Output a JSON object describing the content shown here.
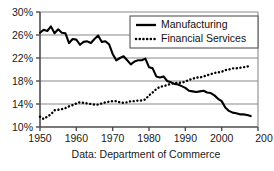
{
  "chart_data": {
    "type": "line",
    "title": "",
    "subtitle": "",
    "xlabel": "",
    "ylabel": "",
    "caption": "Data: Department of Commerce",
    "grid": true,
    "legend_position": "top-right",
    "xlim": [
      1950,
      2010
    ],
    "ylim": [
      10,
      30
    ],
    "x_ticks": [
      1950,
      1960,
      1970,
      1980,
      1990,
      2000,
      2010
    ],
    "x_tick_labels": [
      "1950",
      "1960",
      "1970",
      "1980",
      "1990",
      "2000",
      "200"
    ],
    "y_ticks": [
      10,
      14,
      18,
      22,
      26,
      30
    ],
    "y_tick_labels": [
      "10%",
      "14%",
      "18%",
      "22%",
      "26%",
      "30%"
    ],
    "colors": {
      "manufacturing": "#000000",
      "financial_services": "#000000",
      "grid": "#8a8a8a",
      "axis": "#4d4d4d"
    },
    "series": [
      {
        "name": "Manufacturing",
        "style": "solid",
        "x": [
          1950,
          1951,
          1952,
          1953,
          1954,
          1955,
          1956,
          1957,
          1958,
          1959,
          1960,
          1961,
          1962,
          1963,
          1964,
          1965,
          1966,
          1967,
          1968,
          1969,
          1970,
          1971,
          1972,
          1973,
          1974,
          1975,
          1976,
          1977,
          1978,
          1979,
          1980,
          1981,
          1982,
          1983,
          1984,
          1985,
          1986,
          1987,
          1988,
          1989,
          1990,
          1991,
          1992,
          1993,
          1994,
          1995,
          1996,
          1997,
          1998,
          1999,
          2000,
          2001,
          2002,
          2003,
          2004,
          2005,
          2006,
          2007,
          2008
        ],
        "values": [
          26.4,
          26.9,
          26.7,
          27.5,
          26.3,
          27.0,
          26.4,
          26.3,
          24.6,
          25.3,
          25.2,
          24.3,
          24.8,
          24.9,
          24.6,
          25.3,
          25.9,
          24.8,
          24.9,
          24.4,
          22.7,
          21.6,
          22.0,
          22.3,
          21.6,
          20.9,
          21.4,
          21.6,
          21.6,
          21.9,
          20.4,
          20.2,
          18.8,
          18.6,
          18.8,
          18.0,
          17.8,
          17.5,
          17.4,
          17.1,
          16.8,
          16.3,
          16.2,
          16.1,
          16.2,
          16.3,
          16.0,
          15.9,
          15.5,
          14.9,
          14.5,
          13.4,
          12.8,
          12.5,
          12.4,
          12.2,
          12.2,
          12.1,
          11.9
        ]
      },
      {
        "name": "Financial Services",
        "style": "dotted",
        "x": [
          1950,
          1951,
          1952,
          1953,
          1954,
          1955,
          1956,
          1957,
          1958,
          1959,
          1960,
          1961,
          1962,
          1963,
          1964,
          1965,
          1966,
          1967,
          1968,
          1969,
          1970,
          1971,
          1972,
          1973,
          1974,
          1975,
          1976,
          1977,
          1978,
          1979,
          1980,
          1981,
          1982,
          1983,
          1984,
          1985,
          1986,
          1987,
          1988,
          1989,
          1990,
          1991,
          1992,
          1993,
          1994,
          1995,
          1996,
          1997,
          1998,
          1999,
          2000,
          2001,
          2002,
          2003,
          2004,
          2005,
          2006,
          2007,
          2008
        ],
        "values": [
          11.8,
          11.4,
          11.8,
          12.2,
          12.9,
          13.0,
          13.1,
          13.3,
          13.6,
          13.8,
          14.1,
          14.3,
          14.2,
          14.1,
          14.0,
          13.9,
          13.9,
          14.1,
          14.3,
          14.4,
          14.5,
          14.5,
          14.3,
          14.2,
          14.3,
          14.5,
          14.5,
          14.6,
          14.6,
          14.8,
          15.5,
          16.0,
          16.6,
          17.0,
          17.1,
          17.3,
          17.5,
          17.6,
          17.7,
          17.7,
          17.9,
          18.2,
          18.4,
          18.6,
          18.6,
          18.8,
          19.0,
          19.2,
          19.4,
          19.5,
          19.6,
          19.9,
          20.0,
          20.2,
          20.2,
          20.3,
          20.4,
          20.5,
          20.7
        ]
      }
    ]
  },
  "legend": {
    "entries": [
      {
        "label": "Manufacturing",
        "style": "solid",
        "swatch_name": "solid-line-swatch"
      },
      {
        "label": "Financial Services",
        "style": "dotted",
        "swatch_name": "dotted-line-swatch"
      }
    ]
  }
}
